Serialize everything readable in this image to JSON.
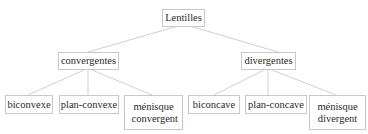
{
  "diagram": {
    "type": "tree",
    "root": {
      "label": "Lentilles",
      "children": [
        {
          "label": "convergentes",
          "children": [
            {
              "label": "biconvexe"
            },
            {
              "label": "plan-convexe"
            },
            {
              "label": "ménisque convergent"
            }
          ]
        },
        {
          "label": "divergentes",
          "children": [
            {
              "label": "biconcave"
            },
            {
              "label": "plan-concave"
            },
            {
              "label": "ménisque divergent"
            }
          ]
        }
      ]
    },
    "colors": {
      "edge": "#d0d0d0",
      "border": "#c8c8c8",
      "text": "#2a2a2a",
      "background": "#ffffff"
    }
  },
  "nodes": {
    "root": "Lentilles",
    "convergentes": "convergentes",
    "divergentes": "divergentes",
    "biconvexe": "biconvexe",
    "plan_convexe": "plan-convexe",
    "menisque_convergent": "ménisque convergent",
    "biconcave": "biconcave",
    "plan_concave": "plan-concave",
    "menisque_divergent": "ménisque divergent"
  }
}
